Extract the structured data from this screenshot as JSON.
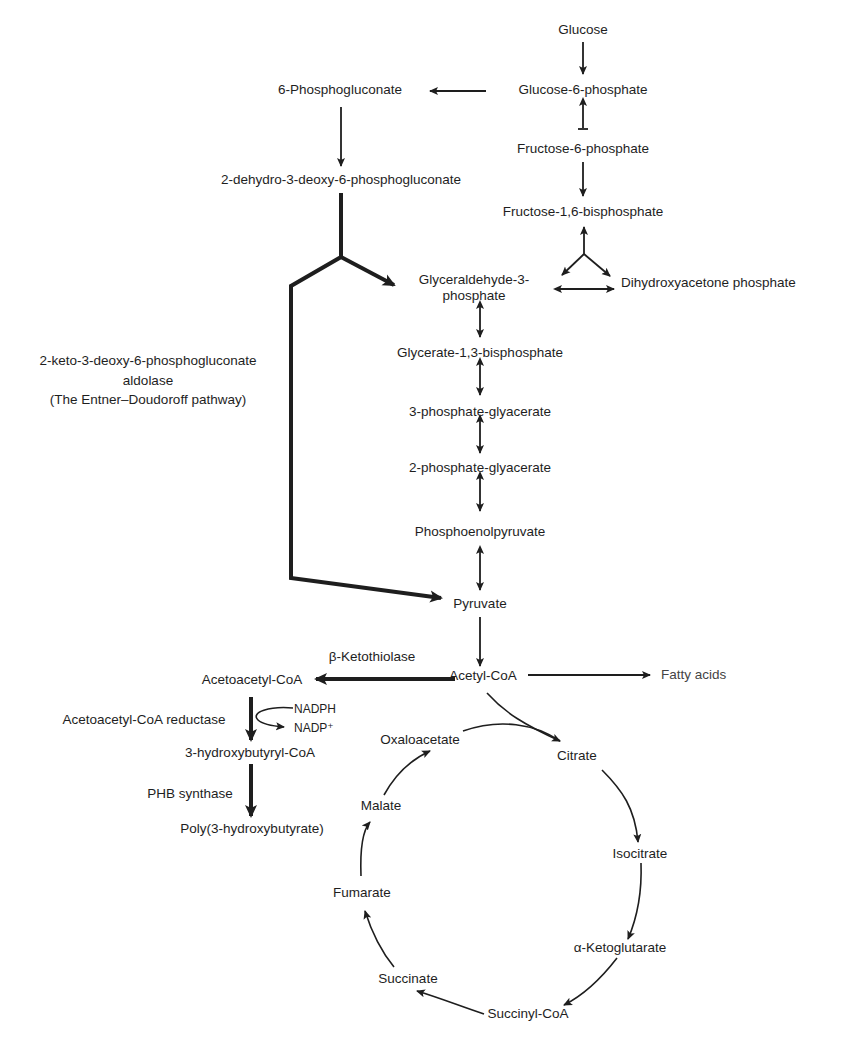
{
  "diagram": {
    "glycolysis": {
      "glucose": "Glucose",
      "g6p": "Glucose-6-phosphate",
      "f6p": "Fructose-6-phosphate",
      "f16bp": "Fructose-1,6-bisphosphate",
      "g3p_line1": "Glyceraldehyde-3-",
      "g3p_line2": "phosphate",
      "dhap": "Dihydroxyacetone phosphate",
      "g13bp": "Glycerate-1,3-bisphosphate",
      "pg3": "3-phosphate-glyacerate",
      "pg2": "2-phosphate-glyacerate",
      "pep": "Phosphoenolpyruvate",
      "pyruvate": "Pyruvate",
      "acetyl_coa": "Acetyl-CoA",
      "fatty_acids": "Fatty acids"
    },
    "ed_pathway": {
      "pgluconate": "6-Phosphogluconate",
      "kdpg": "2-dehydro-3-deoxy-6-phosphogluconate",
      "enzyme_line1": "2-keto-3-deoxy-6-phosphogluconate",
      "enzyme_line2": "aldolase",
      "enzyme_line3": "(The Entner–Doudoroff pathway)"
    },
    "phb": {
      "ketothiolase": "β-Ketothiolase",
      "acetoacetyl_coa": "Acetoacetyl-CoA",
      "reductase": "Acetoacetyl-CoA reductase",
      "nadph": "NADPH",
      "nadp": "NADP⁺",
      "hydroxybutyryl_coa": "3-hydroxybutyryl-CoA",
      "synthase": "PHB synthase",
      "phb": "Poly(3-hydroxybutyrate)"
    },
    "tca": {
      "oxaloacetate": "Oxaloacetate",
      "citrate": "Citrate",
      "isocitrate": "Isocitrate",
      "akg": "α-Ketoglutarate",
      "succinyl_coa": "Succinyl-CoA",
      "succinate": "Succinate",
      "fumarate": "Fumarate",
      "malate": "Malate"
    },
    "colors": {
      "ink": "#1e1e1e",
      "background": "#ffffff"
    }
  }
}
